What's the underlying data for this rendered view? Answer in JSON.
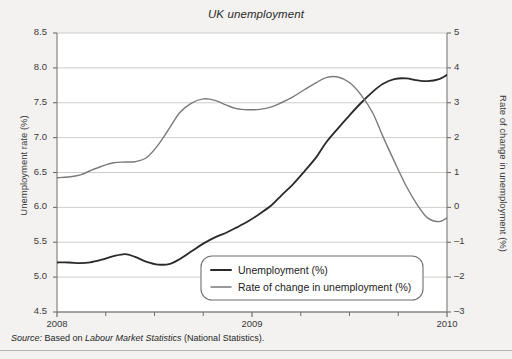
{
  "chart_data": {
    "type": "line",
    "title": "UK unemployment",
    "xlabel": "",
    "ylabel": "Unemployment rate (%)",
    "y2label": "Rate of change in unemployment (%)",
    "grid": true,
    "legend_position": "bottom-center",
    "x_tick_labels": [
      "2008",
      "2009",
      "2010"
    ],
    "x_major_ticks": [
      2008,
      2009,
      2010
    ],
    "x_minor_ticks": [
      2008.25,
      2008.5,
      2008.75,
      2009.25,
      2009.5,
      2009.75
    ],
    "xlim": [
      2008,
      2010
    ],
    "ylim": [
      4.5,
      8.5
    ],
    "y_tick_labels": [
      "4.5",
      "5.0",
      "5.5",
      "6.0",
      "6.5",
      "7.0",
      "7.5",
      "8.0",
      "8.5"
    ],
    "y2lim": [
      -3,
      5
    ],
    "y2_tick_labels": [
      "-3",
      "-2",
      "-1",
      "0",
      "1",
      "2",
      "3",
      "4",
      "5"
    ],
    "series": [
      {
        "name": "Unemployment (%)",
        "axis": "left",
        "color": "#2a2a2a",
        "x": [
          2008.0,
          2008.06,
          2008.12,
          2008.17,
          2008.23,
          2008.29,
          2008.35,
          2008.4,
          2008.46,
          2008.52,
          2008.58,
          2008.63,
          2008.69,
          2008.75,
          2008.81,
          2008.87,
          2008.92,
          2008.98,
          2009.04,
          2009.1,
          2009.15,
          2009.21,
          2009.27,
          2009.33,
          2009.38,
          2009.44,
          2009.5,
          2009.56,
          2009.62,
          2009.67,
          2009.73,
          2009.79,
          2009.85,
          2009.9,
          2009.96,
          2010.0
        ],
        "values": [
          5.21,
          5.21,
          5.2,
          5.21,
          5.25,
          5.3,
          5.33,
          5.29,
          5.22,
          5.18,
          5.19,
          5.26,
          5.37,
          5.48,
          5.57,
          5.64,
          5.71,
          5.8,
          5.91,
          6.03,
          6.17,
          6.33,
          6.52,
          6.72,
          6.93,
          7.13,
          7.32,
          7.5,
          7.66,
          7.77,
          7.84,
          7.85,
          7.82,
          7.81,
          7.84,
          7.9
        ]
      },
      {
        "name": "Rate of change in unemployment (%)",
        "axis": "right",
        "color": "#7a7a7a",
        "x": [
          2008.0,
          2008.06,
          2008.12,
          2008.17,
          2008.23,
          2008.29,
          2008.35,
          2008.4,
          2008.46,
          2008.52,
          2008.58,
          2008.63,
          2008.69,
          2008.75,
          2008.81,
          2008.87,
          2008.92,
          2008.98,
          2009.04,
          2009.1,
          2009.15,
          2009.21,
          2009.27,
          2009.33,
          2009.38,
          2009.44,
          2009.5,
          2009.56,
          2009.62,
          2009.67,
          2009.73,
          2009.79,
          2009.85,
          2009.9,
          2009.96,
          2010.0
        ],
        "values": [
          0.85,
          0.87,
          0.93,
          1.05,
          1.18,
          1.28,
          1.3,
          1.31,
          1.43,
          1.8,
          2.3,
          2.72,
          2.99,
          3.11,
          3.07,
          2.93,
          2.83,
          2.8,
          2.81,
          2.88,
          3.0,
          3.17,
          3.38,
          3.58,
          3.72,
          3.74,
          3.58,
          3.22,
          2.7,
          2.05,
          1.32,
          0.62,
          0.05,
          -0.3,
          -0.41,
          -0.3
        ]
      }
    ],
    "source_note": {
      "prefix": "Source:",
      "middle": " Based on ",
      "italic": "Labour Market Statistics",
      "suffix": " (National Statistics)."
    }
  }
}
